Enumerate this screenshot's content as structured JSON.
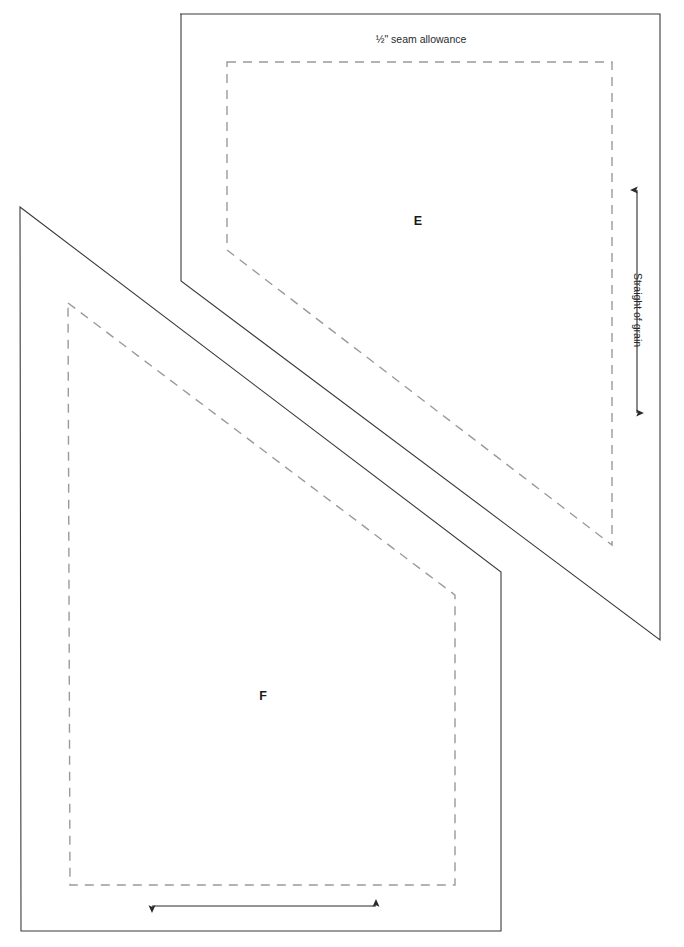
{
  "sheet": {
    "width": 684,
    "height": 947,
    "background_color": "#ffffff",
    "description": "Sewing pattern template sheet with two overlapping pattern pieces"
  },
  "style": {
    "cut_line_color": "#3a3a3a",
    "stitch_line_color": "#9a9a9a",
    "label_color": "#1a1a1a",
    "annotation_color": "#2a2a2a"
  },
  "annotations": {
    "seam_allowance_label": "½\" seam allowance",
    "grain_label": "Straight of grain"
  },
  "pieces": [
    {
      "id": "piece-e",
      "label": "E",
      "label_x": 418,
      "label_y": 222,
      "cut_path": "M 180,14 L 660,14 L 660,640 L 181,281 L 181,14 Z",
      "stitch_path": "M 227,62 L 612,62 L 612,545 L 227,250 L 227,62 Z"
    },
    {
      "id": "piece-f",
      "label": "F",
      "label_x": 263,
      "label_y": 697,
      "cut_path": "M 20,207 L 501,572 L 501,931 L 21,931 L 20,207 Z",
      "stitch_path": "M 68,303 L 455,595 L 455,885 L 70,885 L 68,303 Z"
    }
  ],
  "grain_arrow": {
    "orientation": "vertical",
    "x": 637,
    "y_top": 183,
    "y_bottom": 420,
    "label": "Straight of grain",
    "label_x": 637,
    "label_y": 310
  },
  "width_arrow": {
    "orientation": "horizontal",
    "y": 906,
    "x_left": 145,
    "x_right": 383
  }
}
